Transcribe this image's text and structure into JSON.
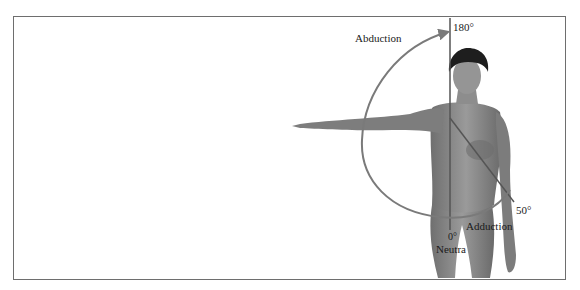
{
  "figure": {
    "labels": {
      "abduction": "Abduction",
      "top_angle": "180°",
      "adduction": "Adduction",
      "adduction_angle": "50°",
      "neutral_angle": "0°",
      "neutral": "Neutral"
    },
    "colors": {
      "arc": "#7a7a7a",
      "axis_line": "#555555",
      "skin": "#8a8a8a",
      "hair": "#1e1e1e",
      "border": "#6e6e6e"
    }
  }
}
